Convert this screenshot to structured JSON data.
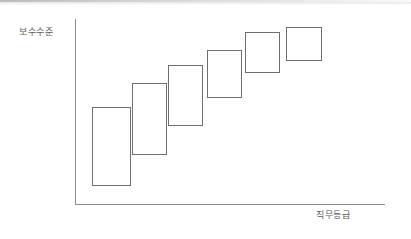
{
  "figure": {
    "width": 411,
    "height": 239,
    "background_color": "#ffffff",
    "line_color": "#6f6f6f",
    "axis_color": "#8d8d8d",
    "text_color": "#5b5b5b"
  },
  "axes": {
    "y_label": "보수수준",
    "x_label": "직무등급"
  },
  "chart_data": {
    "type": "bar",
    "title": "",
    "xlabel": "직무등급",
    "ylabel": "보수수준",
    "grid": false,
    "legend": null,
    "note": "Overlapping pay-band ranges ascending across job grades; each box spans a minimum-to-maximum compensation range for one grade, with adjacent ranges overlapping.",
    "categories": [
      "1",
      "2",
      "3",
      "4",
      "5",
      "6"
    ],
    "bands": [
      {
        "grade": "1",
        "x": 92,
        "y": 107,
        "width": 39,
        "height": 79,
        "range_min": 107,
        "range_max": 186
      },
      {
        "grade": "2",
        "x": 132,
        "y": 83,
        "width": 35,
        "height": 72,
        "range_min": 83,
        "range_max": 155
      },
      {
        "grade": "3",
        "x": 168,
        "y": 65,
        "width": 35,
        "height": 61,
        "range_min": 65,
        "range_max": 126
      },
      {
        "grade": "4",
        "x": 207,
        "y": 50,
        "width": 35,
        "height": 48,
        "range_min": 50,
        "range_max": 98
      },
      {
        "grade": "5",
        "x": 245,
        "y": 32,
        "width": 35,
        "height": 41,
        "range_min": 32,
        "range_max": 73
      },
      {
        "grade": "6",
        "x": 286,
        "y": 27,
        "width": 36,
        "height": 34,
        "range_min": 27,
        "range_max": 61
      }
    ],
    "axis_geometry": {
      "y_axis_x": 75,
      "y_axis_top": 19,
      "y_axis_bottom": 205,
      "x_axis_y": 204,
      "x_axis_left": 75,
      "x_axis_right": 385
    }
  }
}
